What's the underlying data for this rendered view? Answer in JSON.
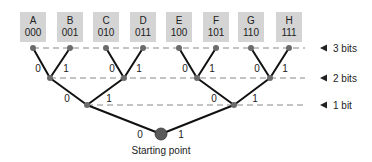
{
  "colors": {
    "box_fill": "#d4d4d4",
    "node": "#6b6b6b",
    "root": "#5a5a5a",
    "edge": "#111111",
    "dashed": "#888888",
    "text": "#222222"
  },
  "leaves": [
    {
      "letter": "A",
      "code": "000"
    },
    {
      "letter": "B",
      "code": "001"
    },
    {
      "letter": "C",
      "code": "010"
    },
    {
      "letter": "D",
      "code": "011"
    },
    {
      "letter": "E",
      "code": "100"
    },
    {
      "letter": "F",
      "code": "101"
    },
    {
      "letter": "G",
      "code": "110"
    },
    {
      "letter": "H",
      "code": "111"
    }
  ],
  "levels": [
    {
      "label": "3 bits"
    },
    {
      "label": "2 bits"
    },
    {
      "label": "1 bit"
    }
  ],
  "edge_labels": {
    "zero": "0",
    "one": "1"
  },
  "root_caption": "Starting point"
}
